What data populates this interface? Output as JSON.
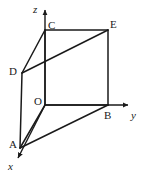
{
  "figure": {
    "kind": "3d-coordinate-solid-diagram",
    "width": 143,
    "height": 175,
    "background_color": "#ffffff",
    "stroke_color": "#1a1a1a",
    "label_color": "#1a1a1a"
  },
  "axes": [
    {
      "id": "z",
      "label": "z",
      "label_x": 33,
      "label_y": 4,
      "direction": "up",
      "from_x": 45,
      "from_y": 105,
      "to_x": 45,
      "to_y": 10,
      "arrow": true
    },
    {
      "id": "y",
      "label": "y",
      "label_x": 131,
      "label_y": 110,
      "direction": "right",
      "from_x": 45,
      "from_y": 105,
      "to_x": 128,
      "to_y": 105,
      "arrow": true
    },
    {
      "id": "x",
      "label": "x",
      "label_x": 8,
      "label_y": 161,
      "direction": "down-left",
      "from_x": 45,
      "from_y": 105,
      "to_x": 18,
      "to_y": 158,
      "arrow": true
    }
  ],
  "vertices": [
    {
      "id": "O",
      "label": "O",
      "x": 45,
      "y": 105,
      "label_x": 34,
      "label_y": 96
    },
    {
      "id": "C",
      "label": "C",
      "x": 45,
      "y": 30,
      "label_x": 48,
      "label_y": 20
    },
    {
      "id": "E",
      "label": "E",
      "x": 108,
      "y": 30,
      "label_x": 110,
      "label_y": 19
    },
    {
      "id": "B",
      "label": "B",
      "x": 108,
      "y": 105,
      "label_x": 104,
      "label_y": 110
    },
    {
      "id": "D",
      "label": "D",
      "x": 22,
      "y": 73,
      "label_x": 9,
      "label_y": 66
    },
    {
      "id": "A",
      "label": "A",
      "x": 20,
      "y": 148,
      "label_x": 9,
      "label_y": 139
    }
  ],
  "edges": [
    {
      "id": "C-E",
      "from": "C",
      "to": "E",
      "style": "solid"
    },
    {
      "id": "C-O",
      "from": "C",
      "to": "O",
      "style": "solid"
    },
    {
      "id": "E-B",
      "from": "E",
      "to": "B",
      "style": "solid"
    },
    {
      "id": "O-B",
      "from": "O",
      "to": "B",
      "style": "solid"
    },
    {
      "id": "D-C",
      "from": "D",
      "to": "C",
      "style": "solid"
    },
    {
      "id": "D-E",
      "from": "D",
      "to": "E",
      "style": "solid"
    },
    {
      "id": "D-A",
      "from": "D",
      "to": "A",
      "style": "solid"
    },
    {
      "id": "A-O",
      "from": "A",
      "to": "O",
      "style": "solid"
    },
    {
      "id": "A-B",
      "from": "A",
      "to": "B",
      "style": "solid"
    }
  ]
}
